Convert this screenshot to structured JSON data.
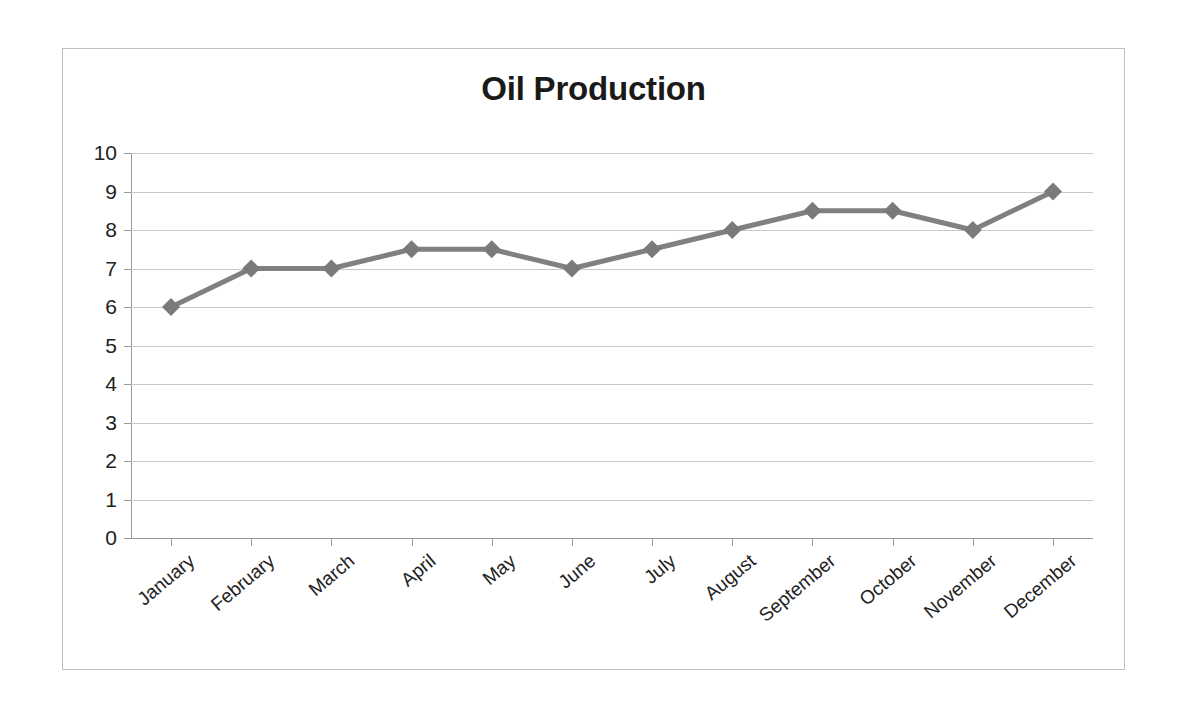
{
  "chart_data": {
    "type": "line",
    "title": "Oil Production",
    "xlabel": "",
    "ylabel": "",
    "categories": [
      "January",
      "February",
      "March",
      "April",
      "May",
      "June",
      "July",
      "August",
      "September",
      "October",
      "November",
      "December"
    ],
    "values": [
      6,
      7,
      7,
      7.5,
      7.5,
      7,
      7.5,
      8,
      8.5,
      8.5,
      8,
      9
    ],
    "series": [
      {
        "name": "Oil Production",
        "values": [
          6,
          7,
          7,
          7.5,
          7.5,
          7,
          7.5,
          8,
          8.5,
          8.5,
          8,
          9
        ]
      }
    ],
    "ylim": [
      0,
      10
    ],
    "ytick_labels": [
      "10",
      "9",
      "8",
      "7",
      "6",
      "5",
      "4",
      "3",
      "2",
      "1",
      "0"
    ],
    "ytick_values": [
      10,
      9,
      8,
      7,
      6,
      5,
      4,
      3,
      2,
      1,
      0
    ],
    "ytick_step": 1,
    "grid": true,
    "grid_axis": "y",
    "legend": "none",
    "marker": "diamond",
    "x_label_rotation_deg": -40,
    "colors": {
      "series_line": "#808080",
      "marker": "#7a7a7a",
      "gridline": "#c9c9c9",
      "axis": "#9a9a9a",
      "frame_border": "#bfbfbf",
      "title_text": "#1a1a1a",
      "tick_text": "#222222",
      "background": "#ffffff"
    }
  }
}
